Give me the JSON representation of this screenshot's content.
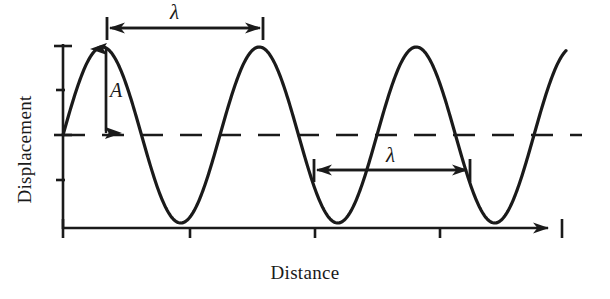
{
  "figure": {
    "kind": "wave-diagram",
    "background_color": "#ffffff",
    "stroke_color": "#1a1a1a",
    "axes": {
      "y_label": "Displacement",
      "x_label": "Distance",
      "y_axis": {
        "x": 63,
        "y_top": 46,
        "y_bottom": 228,
        "ticks_y": [
          46,
          90,
          135,
          180,
          228
        ]
      },
      "x_axis": {
        "y": 228,
        "x_left": 63,
        "x_right": 560,
        "ticks_x": [
          63,
          190,
          315,
          440,
          560
        ],
        "arrow": "right"
      },
      "equilibrium_line": {
        "y": 135,
        "x_left": 63,
        "x_right": 580,
        "style": "dashed"
      }
    },
    "annotations": {
      "lambda_top": {
        "symbol": "λ",
        "x_start": 106,
        "x_end": 263,
        "y": 28,
        "label_x": 180,
        "label_y": 10
      },
      "lambda_bottom": {
        "symbol": "λ",
        "x_start": 313,
        "x_end": 470,
        "y": 170,
        "label_x": 395,
        "label_y": 153
      },
      "amplitude": {
        "symbol": "A",
        "x": 106,
        "y_top": 47,
        "y_bottom": 135,
        "label_x": 118,
        "label_y": 92
      }
    }
  },
  "chart_data": {
    "type": "line",
    "title": "",
    "xlabel": "Distance",
    "ylabel": "Displacement",
    "series": [
      {
        "name": "wave",
        "form": "sine",
        "amplitude_px": 88,
        "wavelength_px": 157,
        "baseline_y_px": 135,
        "crest_y_px": 47,
        "trough_y_px": 228,
        "phase_start_x_px": 63,
        "crests_x_px": [
          106,
          263,
          420,
          577
        ],
        "troughs_x_px": [
          184,
          341,
          498
        ],
        "x_start_px": 63,
        "x_end_px": 566
      }
    ],
    "legend": "none",
    "grid": false,
    "annotations": [
      {
        "text": "λ",
        "meaning": "wavelength",
        "measured_px": 157,
        "location": "crest-to-crest, top"
      },
      {
        "text": "λ",
        "meaning": "wavelength",
        "measured_px": 157,
        "location": "trough-to-trough, lower right"
      },
      {
        "text": "A",
        "meaning": "amplitude",
        "measured_px": 88,
        "location": "equilibrium to first crest"
      }
    ]
  }
}
